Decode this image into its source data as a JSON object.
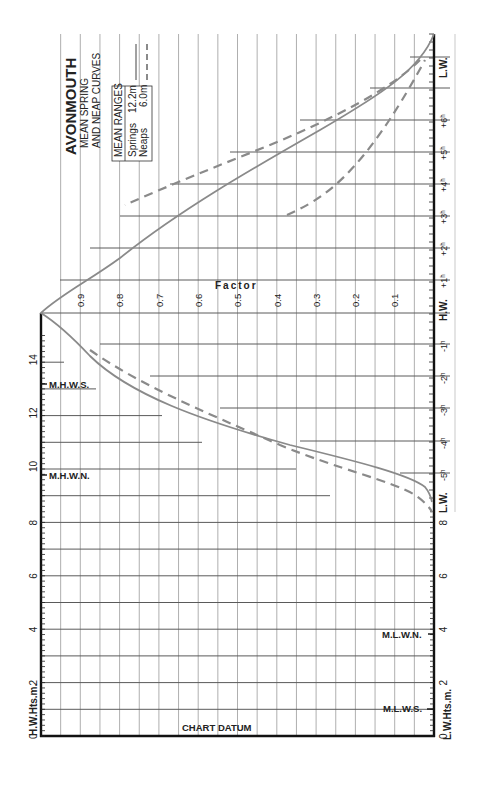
{
  "title": {
    "port": "AVONMOUTH",
    "subtitle_line1": "MEAN SPRING",
    "subtitle_line2": "AND NEAP CURVES"
  },
  "legend": {
    "heading": "MEAN RANGES",
    "springs_label": "Springs",
    "springs_value": "12.2m",
    "neaps_label": "Neaps",
    "neaps_value": "6.0m"
  },
  "axes": {
    "left_label": "H.W.Hts.m.",
    "right_label": "L.W.Hts.m.",
    "factor_label": "Factor",
    "datum_label": "CHART DATUM",
    "left_marks": [
      {
        "label": "M.H.W.S.",
        "value": 13.2
      },
      {
        "label": "M.H.W.N.",
        "value": 9.8
      }
    ],
    "right_marks": [
      {
        "label": "M.L.W.N.",
        "value": 3.8
      },
      {
        "label": "M.L.W.S.",
        "value": 1.0
      }
    ],
    "height_ticks": [
      "0",
      "2",
      "4",
      "6",
      "8",
      "10",
      "12",
      "14"
    ],
    "right_height_ticks": [
      "0",
      "2",
      "4",
      "6",
      "8"
    ],
    "factor_ticks": [
      "0.9",
      "0.8",
      "0.7",
      "0.6",
      "0.5",
      "0.4",
      "0.3",
      "0.2",
      "0.1"
    ],
    "time_ticks": [
      "L.W.",
      "-5h",
      "-4h",
      "-3h",
      "-2h",
      "-1h",
      "H.W.",
      "+1h",
      "+2h",
      "+3h",
      "+4h",
      "+5h",
      "+6h",
      "L.W."
    ]
  },
  "colors": {
    "curve": "#8a8a8a",
    "axis": "#111111",
    "grid": "#9a9a9a"
  },
  "chart_data": {
    "type": "line",
    "xlabel": "Time from High Water (hours)",
    "ylabel": "Factor",
    "x": [
      -5.6,
      -5,
      -4,
      -3,
      -2,
      -1,
      0,
      1,
      2,
      3,
      4,
      5,
      6,
      6.6
    ],
    "series": [
      {
        "name": "Springs (12.2m)",
        "style": "solid",
        "values": [
          0.0,
          0.04,
          0.29,
          0.55,
          0.79,
          0.95,
          1.0,
          0.93,
          0.74,
          0.5,
          0.34,
          0.2,
          0.08,
          0.0
        ]
      },
      {
        "name": "Neaps (6.0m)",
        "style": "dashed",
        "values": [
          0.0,
          0.0,
          0.16,
          0.45,
          0.74,
          0.94,
          1.0,
          0.93,
          0.74,
          0.5,
          0.29,
          0.16,
          0.05,
          0.0
        ]
      }
    ],
    "ylim": [
      0,
      1
    ],
    "hw_height_range_m": [
      0,
      15
    ],
    "lw_height_range_m": [
      0,
      9
    ],
    "grid": true,
    "orientation": "rotated 90° (time runs vertically, factor horizontally)"
  }
}
